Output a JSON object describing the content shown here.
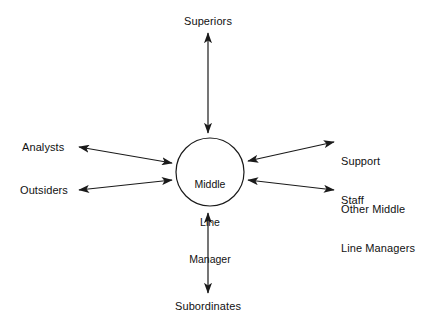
{
  "figure": {
    "background_color": "#ffffff",
    "line_color": "#1a1a1a",
    "text_color": "#111111"
  },
  "center_node": {
    "name": "middle-line-manager",
    "text": "Middle\nLine\nManager",
    "line1": "Middle",
    "line2": "Line",
    "line3": "Manager",
    "shape": "circle"
  },
  "nodes": [
    {
      "id": "superiors",
      "label": "Superiors",
      "position": "top"
    },
    {
      "id": "analysts",
      "label": "Analysts",
      "position": "upper-left"
    },
    {
      "id": "outsiders",
      "label": "Outsiders",
      "position": "lower-left"
    },
    {
      "id": "support-staff",
      "label": "Support\nStaff",
      "position": "upper-right"
    },
    {
      "id": "other-middle-line",
      "label": "Other Middle\nLine Managers",
      "position": "lower-right"
    },
    {
      "id": "subordinates",
      "label": "Subordinates",
      "position": "bottom"
    }
  ],
  "labels": {
    "superiors": "Superiors",
    "subordinates": "Subordinates",
    "analysts": "Analysts",
    "outsiders": "Outsiders",
    "support_staff_line1": "Support",
    "support_staff_line2": "Staff",
    "other_middle_line1": "Other Middle",
    "other_middle_line2": "Line Managers"
  },
  "connectors": [
    {
      "id": "arrow-superiors",
      "from": "middle-line-manager",
      "to": "superiors",
      "style": "double-headed"
    },
    {
      "id": "arrow-subordinates",
      "from": "middle-line-manager",
      "to": "subordinates",
      "style": "double-headed"
    },
    {
      "id": "arrow-analysts",
      "from": "middle-line-manager",
      "to": "analysts",
      "style": "double-headed"
    },
    {
      "id": "arrow-outsiders",
      "from": "middle-line-manager",
      "to": "outsiders",
      "style": "double-headed"
    },
    {
      "id": "arrow-support-staff",
      "from": "middle-line-manager",
      "to": "support-staff",
      "style": "double-headed"
    },
    {
      "id": "arrow-other-middle-line",
      "from": "middle-line-manager",
      "to": "other-middle-line",
      "style": "double-headed"
    }
  ]
}
